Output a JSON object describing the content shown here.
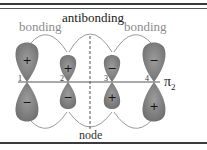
{
  "diagram": {
    "labels": {
      "antibonding": "antibonding",
      "bonding_left": "bonding",
      "bonding_right": "bonding",
      "node": "node",
      "orbital_symbol": "π",
      "orbital_subscript": "2"
    },
    "atoms": [
      {
        "number": "1",
        "top_sign": "+",
        "bottom_sign": "−",
        "size": "large"
      },
      {
        "number": "2",
        "top_sign": "+",
        "bottom_sign": "−",
        "size": "small"
      },
      {
        "number": "3",
        "top_sign": "−",
        "bottom_sign": "+",
        "size": "small"
      },
      {
        "number": "4",
        "top_sign": "−",
        "bottom_sign": "+",
        "size": "large"
      }
    ],
    "colors": {
      "lobe_fill": "#8a8a8a",
      "lobe_dark": "#6e6e6e",
      "arc": "#9a9a9a",
      "axis": "#555555",
      "node_line": "#555555",
      "bonding_text": "#8c8c8c",
      "antibonding_text": "#1a1a1a"
    }
  }
}
